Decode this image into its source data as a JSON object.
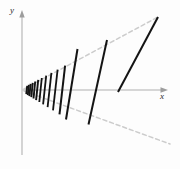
{
  "figure": {
    "name": "line-segment-fan-diagram",
    "background_color": "#fdfdfd",
    "axis_color": "#c9c9c9",
    "segment_color": "#141414",
    "envelope_color": "#cfcfcf"
  },
  "axes": {
    "x": {
      "label": "x",
      "start": [
        22,
        90
      ],
      "end": [
        168,
        90
      ],
      "arrow": true
    },
    "y": {
      "label": "y",
      "start": [
        22,
        155
      ],
      "end": [
        22,
        12
      ],
      "arrow": true
    },
    "origin": [
      22,
      90
    ]
  },
  "envelope": {
    "style": "dashed",
    "upper": {
      "from": [
        24,
        89
      ],
      "to": [
        158,
        17
      ]
    },
    "lower": {
      "from": [
        24,
        91
      ],
      "to": [
        170,
        144
      ]
    }
  },
  "chart_data": {
    "type": "line",
    "title": "",
    "xlabel": "x",
    "ylabel": "y",
    "grid": false,
    "legend": null,
    "segments": [
      {
        "index": 1,
        "x1": 27.2,
        "y1": 85.8,
        "x2": 26.3,
        "y2": 94.2
      },
      {
        "index": 2,
        "x1": 28.8,
        "y1": 84.9,
        "x2": 27.8,
        "y2": 95.1
      },
      {
        "index": 3,
        "x1": 30.6,
        "y1": 83.9,
        "x2": 29.4,
        "y2": 96.1
      },
      {
        "index": 4,
        "x1": 32.7,
        "y1": 82.8,
        "x2": 31.3,
        "y2": 97.2
      },
      {
        "index": 5,
        "x1": 35.2,
        "y1": 81.5,
        "x2": 33.5,
        "y2": 98.5
      },
      {
        "index": 6,
        "x1": 38.2,
        "y1": 79.9,
        "x2": 36.1,
        "y2": 100.1
      },
      {
        "index": 7,
        "x1": 41.8,
        "y1": 78.0,
        "x2": 39.3,
        "y2": 102.0
      },
      {
        "index": 8,
        "x1": 46.2,
        "y1": 75.7,
        "x2": 43.1,
        "y2": 104.3
      },
      {
        "index": 9,
        "x1": 51.4,
        "y1": 72.9,
        "x2": 47.6,
        "y2": 107.1
      },
      {
        "index": 10,
        "x1": 57.6,
        "y1": 69.6,
        "x2": 53.0,
        "y2": 110.4
      },
      {
        "index": 11,
        "x1": 65.1,
        "y1": 65.6,
        "x2": 59.5,
        "y2": 114.4
      },
      {
        "index": 12,
        "x1": 77.5,
        "y1": 49.0,
        "x2": 66.0,
        "y2": 119.5
      },
      {
        "index": 13,
        "x1": 107.0,
        "y1": 40.0,
        "x2": 88.5,
        "y2": 124.5
      },
      {
        "index": 14,
        "x1": 158.0,
        "y1": 17.0,
        "x2": 118.0,
        "y2": 92.0
      }
    ]
  }
}
